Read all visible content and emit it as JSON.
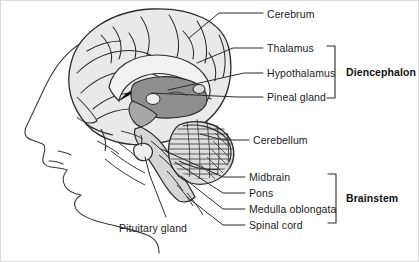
{
  "figure": {
    "background_color": "#ffffff",
    "border_color": "#d9d9d9",
    "line_color": "#2b2b2b",
    "text_color": "#1b1b1b",
    "tissue_fill_light": "#e8e8e8",
    "tissue_fill_mid": "#c9c9c9",
    "tissue_fill_dark": "#9a9a9a"
  },
  "labels": [
    {
      "id": "cerebrum",
      "text": "Cerebrum",
      "x": 266,
      "y": 8
    },
    {
      "id": "thalamus",
      "text": "Thalamus",
      "x": 266,
      "y": 42
    },
    {
      "id": "hypothalamus",
      "text": "Hypothalamus",
      "x": 266,
      "y": 67
    },
    {
      "id": "pineal-gland",
      "text": "Pineal gland",
      "x": 266,
      "y": 91
    },
    {
      "id": "cerebellum",
      "text": "Cerebellum",
      "x": 252,
      "y": 134
    },
    {
      "id": "midbrain",
      "text": "Midbrain",
      "x": 248,
      "y": 171
    },
    {
      "id": "pons",
      "text": "Pons",
      "x": 248,
      "y": 187
    },
    {
      "id": "medulla-oblongata",
      "text": "Medulla oblongata",
      "x": 248,
      "y": 203
    },
    {
      "id": "spinal-cord",
      "text": "Spinal cord",
      "x": 248,
      "y": 219
    },
    {
      "id": "pituitary-gland",
      "text": "Pituitary gland",
      "x": 118,
      "y": 222
    }
  ],
  "group_labels": [
    {
      "id": "diencephalon",
      "text": "Diencephalon",
      "x": 345,
      "y": 66,
      "bracket": {
        "x": 334,
        "top": 45,
        "bottom": 97
      }
    },
    {
      "id": "brainstem",
      "text": "Brainstem",
      "x": 345,
      "y": 192,
      "bracket": {
        "x": 334,
        "top": 173,
        "bottom": 222
      }
    }
  ],
  "leader_lines": [
    {
      "id": "cerebrum-leader",
      "points": "262,12 218,12 188,37"
    },
    {
      "id": "thalamus-leader",
      "points": "262,47 232,47 196,62"
    },
    {
      "id": "hypothalamus-leader",
      "points": "262,72 243,72 167,89"
    },
    {
      "id": "pineal-gland-leader",
      "points": "262,96 236,96 150,92"
    },
    {
      "id": "cerebellum-leader",
      "points": "248,139 222,139 199,133"
    },
    {
      "id": "midbrain-leader",
      "points": "244,176 222,176 160,148"
    },
    {
      "id": "pons-leader",
      "points": "244,192 222,192 174,161"
    },
    {
      "id": "medulla-oblongata-leader",
      "points": "244,208 222,208 180,175"
    },
    {
      "id": "spinal-cord-leader",
      "points": "244,224 222,224 186,196"
    },
    {
      "id": "pituitary-gland-leader",
      "points": "165,216 149,175 144,156"
    }
  ]
}
